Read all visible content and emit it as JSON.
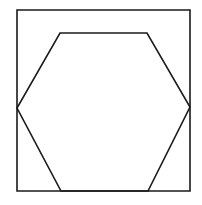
{
  "figure": {
    "background_color": "#ffffff",
    "stroke_color": "#1a1a1a",
    "fill_color": "none",
    "stroke_width": 1.6,
    "canvas": {
      "width": 202,
      "height": 205
    },
    "shapes": [
      {
        "name": "square",
        "type": "polygon",
        "sides": 4,
        "points": "17,10 190,10 190,191 17,191",
        "closed": true
      },
      {
        "name": "hexagon",
        "type": "polygon",
        "sides": 6,
        "points": "60,33 147,33 190,107 148,191 61,191 17,108",
        "closed": true
      }
    ],
    "vertices": {
      "square": [
        {
          "label": "top-left",
          "x": 17,
          "y": 10
        },
        {
          "label": "top-right",
          "x": 190,
          "y": 10
        },
        {
          "label": "bottom-right",
          "x": 190,
          "y": 191
        },
        {
          "label": "bottom-left",
          "x": 17,
          "y": 191
        }
      ],
      "hexagon": [
        {
          "label": "top-left",
          "x": 60,
          "y": 33
        },
        {
          "label": "top-right",
          "x": 147,
          "y": 33
        },
        {
          "label": "right",
          "x": 190,
          "y": 107
        },
        {
          "label": "bottom-right",
          "x": 148,
          "y": 191
        },
        {
          "label": "bottom-left",
          "x": 61,
          "y": 191
        },
        {
          "label": "left",
          "x": 17,
          "y": 108
        }
      ]
    }
  }
}
